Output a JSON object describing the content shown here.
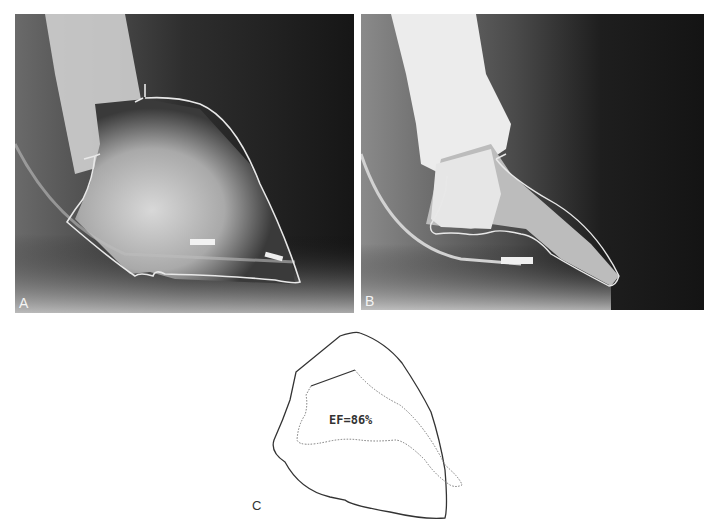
{
  "figure": {
    "panels": [
      {
        "id": "A",
        "label": "A",
        "description": "Left ventriculogram, end-diastolic frame with traced contour"
      },
      {
        "id": "B",
        "label": "B",
        "description": "Left ventriculogram, end-systolic frame with traced contour"
      },
      {
        "id": "C",
        "label": "C",
        "description": "Overlay of end-diastolic (solid) and end-systolic (dotted) outlines"
      }
    ],
    "annotation": "EF=86%"
  },
  "colors": {
    "background": "#ffffff",
    "xray_dark": "#1c1c1c",
    "contour_line": "#e8e8e8",
    "diagram_line": "#333333"
  }
}
